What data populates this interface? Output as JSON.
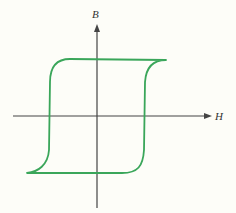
{
  "diagram": {
    "axes": {
      "x_label": "H",
      "y_label": "B"
    },
    "colors": {
      "loop": "#3aa65a",
      "axis": "#444444",
      "background": "#fdfdf8"
    }
  }
}
